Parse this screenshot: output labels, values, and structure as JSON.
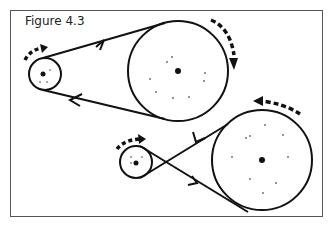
{
  "figure": {
    "caption": "Figure 4.3",
    "colors": {
      "ink": "#111111",
      "frame": "#555555",
      "background": "#ffffff"
    }
  },
  "diagram": {
    "systems": [
      {
        "name": "open-belt",
        "small_pulley": {
          "cx": 45,
          "cy": 74,
          "r": 16,
          "rotation": "clockwise"
        },
        "large_pulley": {
          "cx": 178,
          "cy": 71,
          "r": 50,
          "rotation": "clockwise"
        }
      },
      {
        "name": "crossed-belt",
        "small_pulley": {
          "cx": 136,
          "cy": 162,
          "r": 16,
          "rotation": "clockwise"
        },
        "large_pulley": {
          "cx": 262,
          "cy": 160,
          "r": 50,
          "rotation": "counterclockwise"
        }
      }
    ]
  }
}
